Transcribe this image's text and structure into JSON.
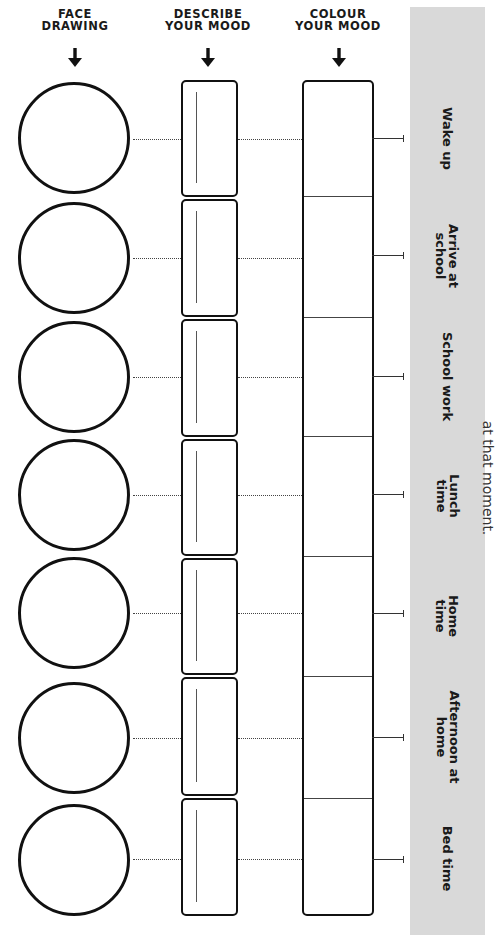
{
  "headers": {
    "face": {
      "line1": "FACE",
      "line2": "DRAWING"
    },
    "describe": {
      "line1": "DESCRIBE",
      "line2": "YOUR MOOD"
    },
    "colour": {
      "line1": "COLOUR",
      "line2": "YOUR MOOD"
    }
  },
  "icons": {
    "header_arrow": "arrow-down-icon"
  },
  "side_note": "at that moment.",
  "rows": [
    {
      "label": "Wake up"
    },
    {
      "label": "Arrive at\nschool"
    },
    {
      "label": "School work"
    },
    {
      "label": "Lunch\ntime"
    },
    {
      "label": "Home\ntime"
    },
    {
      "label": "Afternoon at\nhome"
    },
    {
      "label": "Bed time"
    }
  ],
  "colors": {
    "sidebar_bg": "#d9d9d9",
    "ink": "#111111"
  }
}
